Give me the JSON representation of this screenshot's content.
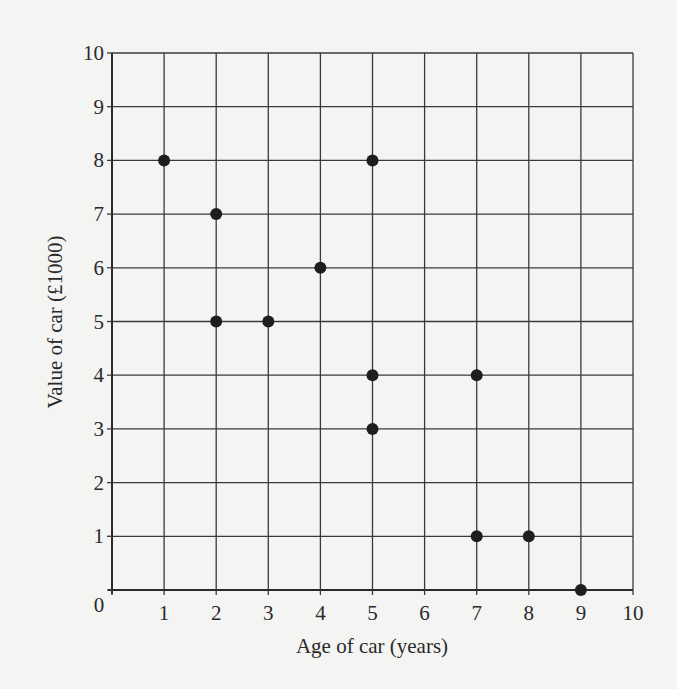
{
  "chart_data": {
    "type": "scatter",
    "title": "",
    "xlabel": "Age of car (years)",
    "ylabel": "Value of car (£1000)",
    "xlim": [
      0,
      10
    ],
    "ylim": [
      0,
      10
    ],
    "grid": true,
    "legend": null,
    "x_ticks": [
      "0",
      "1",
      "2",
      "3",
      "4",
      "5",
      "6",
      "7",
      "8",
      "9",
      "10"
    ],
    "y_ticks": [
      "0",
      "1",
      "2",
      "3",
      "4",
      "5",
      "6",
      "7",
      "8",
      "9",
      "10"
    ],
    "series": [
      {
        "name": "Cars",
        "points": [
          {
            "x": 1,
            "y": 8
          },
          {
            "x": 2,
            "y": 7
          },
          {
            "x": 2,
            "y": 5
          },
          {
            "x": 3,
            "y": 5
          },
          {
            "x": 4,
            "y": 6
          },
          {
            "x": 5,
            "y": 8
          },
          {
            "x": 5,
            "y": 4
          },
          {
            "x": 5,
            "y": 3
          },
          {
            "x": 7,
            "y": 4
          },
          {
            "x": 7,
            "y": 1
          },
          {
            "x": 8,
            "y": 1
          },
          {
            "x": 9,
            "y": 0
          }
        ]
      }
    ]
  },
  "colors": {
    "background": "#f4f4f2",
    "grid": "#3a3a3a",
    "point": "#1e1e1e",
    "text": "#2a2a2a"
  }
}
